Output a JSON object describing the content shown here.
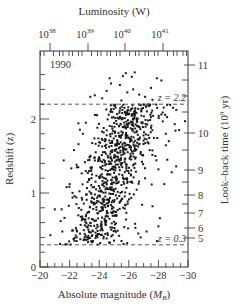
{
  "chart_data": {
    "type": "scatter",
    "title": "",
    "annotation_year": "1990",
    "xlabel": "Absolute magnitude (M_B)",
    "xlabel_main": "Absolute magnitude (",
    "xlabel_sym": "M",
    "xlabel_sub": "B",
    "xlabel_end": ")",
    "ylabel": "Redshift (z)",
    "top_label": "Luminosity (W)",
    "right_label": "Look–back time (10^9 yr)",
    "right_label_main": "Look–back time (10",
    "right_label_sup": "9",
    "right_label_end": " yr)",
    "xlim": [
      -20,
      -30
    ],
    "ylim": [
      0,
      2.65
    ],
    "grid": false,
    "x_ticks": [
      {
        "value": -20,
        "label": "−20"
      },
      {
        "value": -22,
        "label": "−22"
      },
      {
        "value": -24,
        "label": "−24"
      },
      {
        "value": -26,
        "label": "−26"
      },
      {
        "value": -28,
        "label": "−28"
      },
      {
        "value": -30,
        "label": "−30"
      }
    ],
    "y_ticks": [
      {
        "value": 0,
        "label": "0"
      },
      {
        "value": 1,
        "label": "1"
      },
      {
        "value": 2,
        "label": "2"
      }
    ],
    "top_ticks": [
      {
        "exp": "38",
        "base": "10",
        "x_px": 50
      },
      {
        "exp": "39",
        "base": "10",
        "x_px": 88
      },
      {
        "exp": "40",
        "base": "10",
        "x_px": 125
      },
      {
        "exp": "41",
        "base": "10",
        "x_px": 163
      }
    ],
    "right_ticks": [
      {
        "label": "11",
        "y_px": 65
      },
      {
        "label": "10",
        "y_px": 133
      },
      {
        "label": "9",
        "y_px": 170
      },
      {
        "label": "8",
        "y_px": 195
      },
      {
        "label": "7",
        "y_px": 213
      },
      {
        "label": "6",
        "y_px": 228
      },
      {
        "label": "5",
        "y_px": 238
      }
    ],
    "reference_lines": [
      {
        "z": 2.2,
        "label": "z = 2.2",
        "style": "dashed"
      },
      {
        "z": 0.3,
        "label": "z = 0.3",
        "style": "dashed"
      }
    ],
    "series": [
      {
        "name": "quasars",
        "description": "~900 quasars; magnitude brightens with redshift; dense band between z=0.3 and z=2.2",
        "generator": {
          "seed": 1990,
          "count": 820,
          "z_range": [
            0.3,
            2.2
          ],
          "mag_center_at_z0": -23.0,
          "mag_slope_per_z": -1.55,
          "mag_spread": 1.05
        },
        "points": [
          [
            -25.8,
            2.62
          ],
          [
            -25.6,
            2.58
          ],
          [
            -26.4,
            2.63
          ],
          [
            -26.2,
            2.57
          ],
          [
            -24.7,
            2.55
          ],
          [
            -27.9,
            2.55
          ],
          [
            -28.2,
            2.52
          ],
          [
            -24.8,
            2.48
          ],
          [
            -25.4,
            2.46
          ],
          [
            -27.5,
            2.42
          ],
          [
            -24.5,
            2.38
          ],
          [
            -23.7,
            2.32
          ],
          [
            -23.4,
            2.3
          ],
          [
            -24.2,
            2.28
          ],
          [
            -25.9,
            2.36
          ],
          [
            -26.3,
            2.4
          ],
          [
            -27.1,
            2.3
          ],
          [
            -27.6,
            2.26
          ],
          [
            -26.7,
            2.33
          ],
          [
            -25.5,
            2.25
          ],
          [
            -28.3,
            2.24
          ],
          [
            -28.8,
            2.19
          ],
          [
            -29.8,
            1.97
          ],
          [
            -29.1,
            1.93
          ],
          [
            -29.4,
            1.85
          ],
          [
            -28.5,
            1.8
          ],
          [
            -28.7,
            1.7
          ],
          [
            -27.8,
            1.5
          ],
          [
            -28.6,
            1.45
          ],
          [
            -29.2,
            1.36
          ],
          [
            -28.0,
            1.32
          ],
          [
            -28.9,
            1.28
          ],
          [
            -28.4,
            1.12
          ],
          [
            -27.6,
            0.82
          ],
          [
            -28.1,
            0.66
          ],
          [
            -28.0,
            0.55
          ],
          [
            -21.0,
            0.78
          ],
          [
            -21.4,
            0.62
          ],
          [
            -20.7,
            0.43
          ],
          [
            -21.8,
            1.08
          ],
          [
            -22.0,
            1.12
          ],
          [
            -21.6,
            1.44
          ],
          [
            -22.3,
            1.58
          ],
          [
            -22.9,
            1.8
          ],
          [
            -22.6,
            1.66
          ],
          [
            -23.1,
            1.95
          ],
          [
            -27.2,
            0.48
          ],
          [
            -26.8,
            0.4
          ],
          [
            -27.9,
            0.35
          ]
        ]
      }
    ]
  },
  "colors": {
    "axis": "#444444",
    "dot": "#1a1a1a",
    "text": "#333333",
    "background": "#ffffff"
  },
  "plot_frame_px": {
    "left": 40,
    "right": 188,
    "top": 51,
    "bottom": 267
  }
}
